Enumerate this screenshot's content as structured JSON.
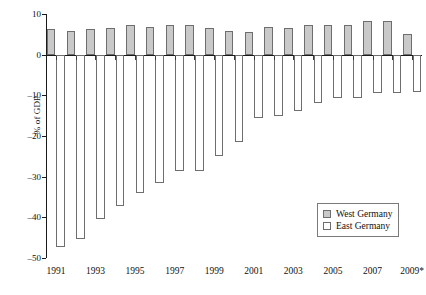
{
  "chart_data": {
    "type": "bar",
    "title": "",
    "subtitle": "",
    "xlabel": "",
    "ylabel": "% of GDP",
    "ylim": [
      -50,
      10
    ],
    "yticks": [
      10,
      0,
      -10,
      -20,
      -30,
      -40,
      -50
    ],
    "ytick_labels": [
      "10",
      "0",
      "–10",
      "–20",
      "–30",
      "–40",
      "–50"
    ],
    "grid": false,
    "legend_position": "bottom-right",
    "categories": [
      "1991",
      "1992",
      "1993",
      "1994",
      "1995",
      "1996",
      "1997",
      "1998",
      "1999",
      "2000",
      "2001",
      "2002",
      "2003",
      "2004",
      "2005",
      "2006",
      "2007",
      "2008",
      "2009*"
    ],
    "xtick_labels": [
      "1991",
      "1993",
      "1995",
      "1997",
      "1999",
      "2001",
      "2003",
      "2005",
      "2007",
      "2009*"
    ],
    "series": [
      {
        "name": "West Germany",
        "color": "#c9c9c9",
        "values": [
          6.3,
          5.9,
          6.3,
          6.6,
          7.2,
          6.9,
          7.3,
          7.3,
          6.5,
          5.8,
          5.6,
          6.8,
          6.6,
          7.4,
          7.4,
          7.4,
          8.4,
          8.4,
          5.2
        ]
      },
      {
        "name": "East Germany",
        "color": "#ffffff",
        "values": [
          -47.3,
          -45.4,
          -40.4,
          -37.3,
          -34.0,
          -31.6,
          -28.5,
          -28.7,
          -24.9,
          -21.4,
          -15.6,
          -15.0,
          -13.9,
          -12.0,
          -10.6,
          -10.6,
          -9.5,
          -9.4,
          -9.1
        ]
      }
    ],
    "annotations": [
      "* 2009 values are provisional"
    ]
  },
  "legend": {
    "items": [
      {
        "label": "West Germany",
        "swatch": "filled-gray"
      },
      {
        "label": "East Germany",
        "swatch": "outline-white"
      }
    ]
  }
}
